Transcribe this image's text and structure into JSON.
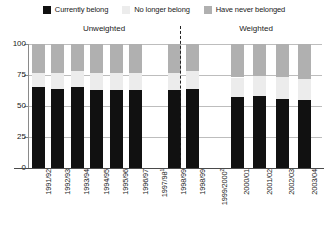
{
  "legend": {
    "items": [
      {
        "label": "Currently belong",
        "color": "#111111",
        "icon": "legend-swatch-currently-belong"
      },
      {
        "label": "No longer belong",
        "color": "#ececec",
        "icon": "legend-swatch-no-longer-belong"
      },
      {
        "label": "Have never belonged",
        "color": "#b0b0b0",
        "icon": "legend-swatch-have-never-belonged"
      }
    ]
  },
  "groups": {
    "left": "Unweighted",
    "right": "Weighted"
  },
  "yaxis": {
    "ticks": [
      "0",
      "25",
      "50",
      "75",
      "100"
    ]
  },
  "chart_data": {
    "type": "bar",
    "title": "",
    "subtitle": "",
    "xlabel": "",
    "ylabel": "",
    "ylim": [
      0,
      100
    ],
    "yticks": [
      0,
      25,
      50,
      75,
      100
    ],
    "grid": true,
    "stacked": true,
    "legend_position": "top-center",
    "group_labels": [
      "Unweighted",
      "Weighted"
    ],
    "divider_after_category_index": 7,
    "categories": [
      "1991/92",
      "1992/93",
      "1993/94",
      "1994/95",
      "1995/96",
      "1996/97",
      "1997/98",
      "1998/99",
      "1998/99",
      "1999/2000",
      "2000/01",
      "2001/02",
      "2002/03",
      "2003/04"
    ],
    "category_groups": [
      "Unweighted",
      "Unweighted",
      "Unweighted",
      "Unweighted",
      "Unweighted",
      "Unweighted",
      "Unweighted",
      "Unweighted",
      "Weighted",
      "Weighted",
      "Weighted",
      "Weighted",
      "Weighted",
      "Weighted"
    ],
    "category_footnote_markers": [
      "",
      "",
      "",
      "",
      "",
      "",
      "1",
      "",
      "",
      "2",
      "",
      "",
      "",
      ""
    ],
    "series": [
      {
        "name": "Currently belong",
        "color": "#111111",
        "values": [
          65,
          64,
          65,
          63,
          63,
          63,
          null,
          63,
          64,
          null,
          57,
          58,
          56,
          55
        ]
      },
      {
        "name": "No longer belong",
        "color": "#ececec",
        "values": [
          12,
          13,
          13,
          14,
          14,
          14,
          null,
          14,
          14,
          null,
          16,
          16,
          17,
          17
        ]
      },
      {
        "name": "Have never belonged",
        "color": "#b0b0b0",
        "values": [
          23,
          23,
          22,
          23,
          23,
          23,
          null,
          23,
          22,
          null,
          27,
          26,
          27,
          28
        ]
      }
    ],
    "missing_categories": [
      "1997/98",
      "1999/2000"
    ]
  }
}
